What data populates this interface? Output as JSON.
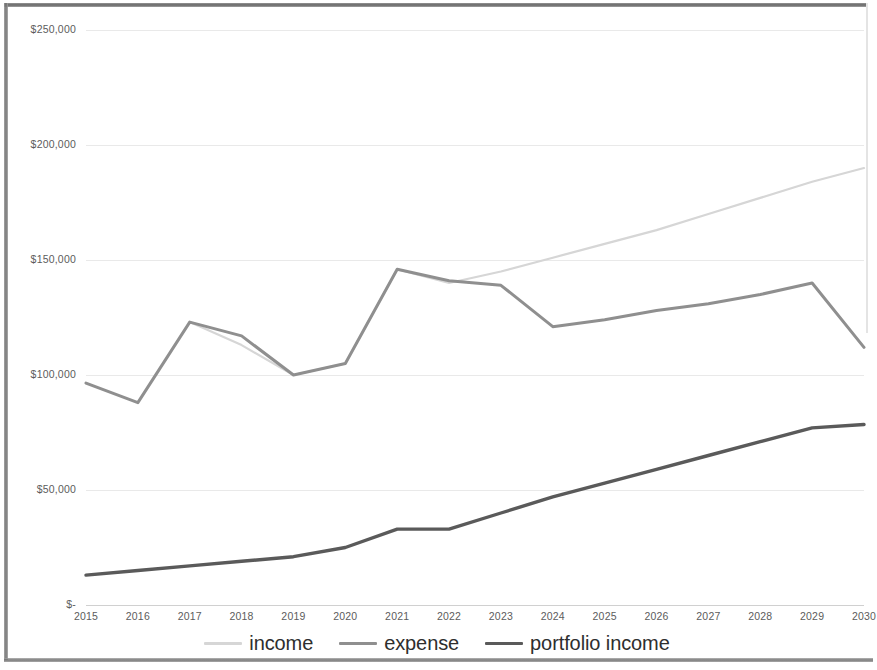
{
  "chart_data": {
    "type": "line",
    "title": "",
    "xlabel": "",
    "ylabel": "",
    "grid": true,
    "legend_position": "bottom",
    "ylim": [
      0,
      250000
    ],
    "yticks": [
      0,
      50000,
      100000,
      150000,
      200000,
      250000
    ],
    "ytick_labels": [
      "$-",
      "$50,000",
      "$100,000",
      "$150,000",
      "$200,000",
      "$250,000"
    ],
    "x": [
      2015,
      2016,
      2017,
      2018,
      2019,
      2020,
      2021,
      2022,
      2023,
      2024,
      2025,
      2026,
      2027,
      2028,
      2029,
      2030
    ],
    "categories": [
      "2015",
      "2016",
      "2017",
      "2018",
      "2019",
      "2020",
      "2021",
      "2022",
      "2023",
      "2024",
      "2025",
      "2026",
      "2027",
      "2028",
      "2029",
      "2030"
    ],
    "series": [
      {
        "name": "income",
        "color": "#d6d6d6",
        "values": [
          null,
          null,
          123000,
          113000,
          100000,
          105000,
          146000,
          140000,
          145000,
          151000,
          157000,
          163000,
          170000,
          177000,
          184000,
          190000
        ]
      },
      {
        "name": "expense",
        "color": "#8f8f8f",
        "values": [
          96500,
          88000,
          123000,
          117000,
          100000,
          105000,
          146000,
          141000,
          139000,
          121000,
          124000,
          128000,
          131000,
          135000,
          140000,
          112000
        ]
      },
      {
        "name": "portfolio income",
        "color": "#5a5a5a",
        "values": [
          13000,
          15000,
          17000,
          19000,
          21000,
          25000,
          33000,
          33000,
          40000,
          47000,
          53000,
          59000,
          65000,
          71000,
          77000,
          78500
        ]
      }
    ]
  },
  "axis": {
    "y_labels": [
      "$250,000",
      "$200,000",
      "$150,000",
      "$100,000",
      "$50,000",
      "$-"
    ],
    "x_labels": [
      "2015",
      "2016",
      "2017",
      "2018",
      "2019",
      "2020",
      "2021",
      "2022",
      "2023",
      "2024",
      "2025",
      "2026",
      "2027",
      "2028",
      "2029",
      "2030"
    ]
  },
  "legend": {
    "items": [
      {
        "label": "income",
        "color": "#d6d6d6"
      },
      {
        "label": "expense",
        "color": "#8f8f8f"
      },
      {
        "label": "portfolio income",
        "color": "#5a5a5a"
      }
    ]
  }
}
